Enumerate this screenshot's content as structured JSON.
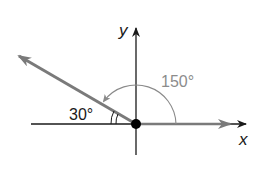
{
  "diagram": {
    "type": "angle-on-coordinate-plane",
    "axes": {
      "x_label": "x",
      "y_label": "y"
    },
    "angles": [
      {
        "label": "150°",
        "description": "angle measured counterclockwise from positive x-axis to ray"
      },
      {
        "label": "30°",
        "description": "reference angle between ray and negative x-axis"
      }
    ],
    "colors": {
      "axis": "#1a1a1a",
      "ray": "#7a7a7a",
      "arc": "#8a8a8a",
      "label_gray": "#8c8c8c"
    }
  }
}
